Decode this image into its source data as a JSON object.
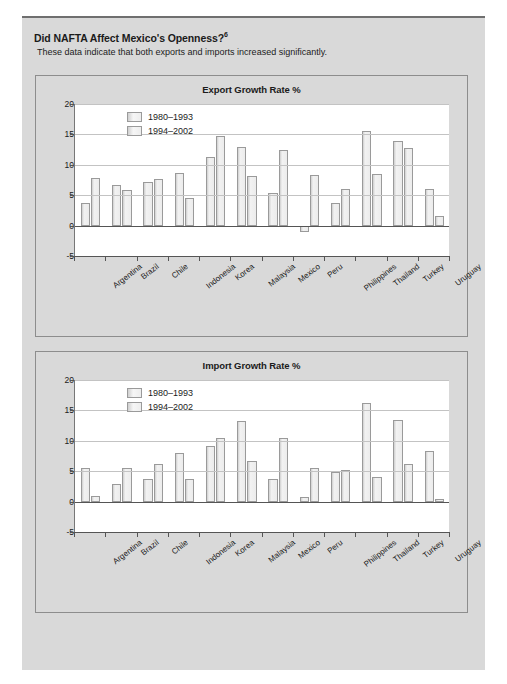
{
  "header": {
    "title": "Did NAFTA Affect Mexico's Openness?",
    "title_superscript": "6",
    "subtitle": "These data indicate that both exports and imports increased significantly."
  },
  "axis": {
    "yticks": [
      "20",
      "15",
      "10",
      "5",
      "0",
      "-5"
    ],
    "ymax": 20,
    "ymin": -5
  },
  "legend": {
    "series1": "1980–1993",
    "series2": "1994–2002"
  },
  "chart_data": [
    {
      "type": "bar",
      "title": "Export Growth Rate %",
      "xlabel": "",
      "ylabel": "",
      "ylim": [
        -5,
        20
      ],
      "grid": true,
      "legend_position": "top-left",
      "categories": [
        "Argentina",
        "Brazil",
        "Chile",
        "Indonesia",
        "Korea",
        "Malaysia",
        "Mexico",
        "Peru",
        "Philippines",
        "Thailand",
        "Turkey",
        "Uruguay"
      ],
      "series": [
        {
          "name": "1980–1993",
          "values": [
            3.8,
            6.7,
            7.1,
            8.7,
            11.3,
            13.0,
            5.3,
            -1.0,
            3.7,
            15.6,
            14.0,
            6.0
          ]
        },
        {
          "name": "1994–2002",
          "values": [
            7.8,
            5.9,
            7.6,
            4.5,
            14.8,
            8.2,
            12.5,
            8.3,
            6.0,
            8.5,
            12.7,
            1.6
          ]
        }
      ]
    },
    {
      "type": "bar",
      "title": "Import Growth Rate %",
      "xlabel": "",
      "ylabel": "",
      "ylim": [
        -5,
        20
      ],
      "grid": true,
      "legend_position": "top-left",
      "categories": [
        "Argentina",
        "Brazil",
        "Chile",
        "Indonesia",
        "Korea",
        "Malaysia",
        "Mexico",
        "Peru",
        "Philippines",
        "Thailand",
        "Turkey",
        "Uruguay"
      ],
      "series": [
        {
          "name": "1980–1993",
          "values": [
            5.5,
            2.9,
            3.8,
            8.0,
            9.1,
            13.2,
            3.8,
            0.8,
            4.9,
            16.2,
            13.4,
            8.4
          ]
        },
        {
          "name": "1994–2002",
          "values": [
            0.9,
            5.6,
            6.2,
            3.7,
            10.4,
            6.7,
            10.4,
            5.6,
            5.2,
            4.1,
            6.2,
            0.5
          ]
        }
      ]
    }
  ]
}
